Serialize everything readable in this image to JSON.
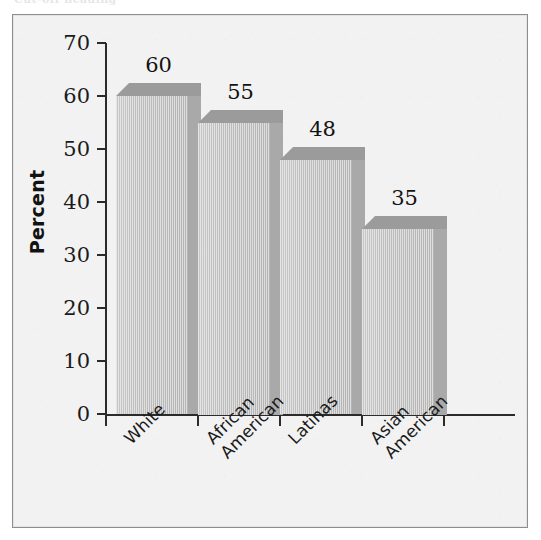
{
  "page": {
    "top_cut_text": "Cut-off heading"
  },
  "chart_data": {
    "type": "bar",
    "title": "",
    "subtitle": "",
    "xlabel": "",
    "ylabel": "Percent",
    "ylim": [
      0,
      70
    ],
    "ytick_step": 10,
    "yticks": [
      70,
      60,
      50,
      40,
      30,
      20,
      10,
      0
    ],
    "grid": false,
    "legend": null,
    "style": "3d-bar",
    "categories": [
      "White",
      "African American",
      "Latinas",
      "Asian American"
    ],
    "category_lines": [
      [
        "White"
      ],
      [
        "African",
        "American"
      ],
      [
        "Latinas"
      ],
      [
        "Asian",
        "American"
      ]
    ],
    "values": [
      60,
      55,
      48,
      35
    ],
    "value_labels": [
      "60",
      "55",
      "48",
      "35"
    ],
    "colors": {
      "bar_front": "#bcbcbc",
      "bar_top": "#9b9b9b",
      "bar_side": "#a9a9a9",
      "plot_background": "#f2f2f2",
      "frame_border": "#8e8e8e",
      "axis": "#2b2b2b",
      "text": "#141414"
    }
  }
}
